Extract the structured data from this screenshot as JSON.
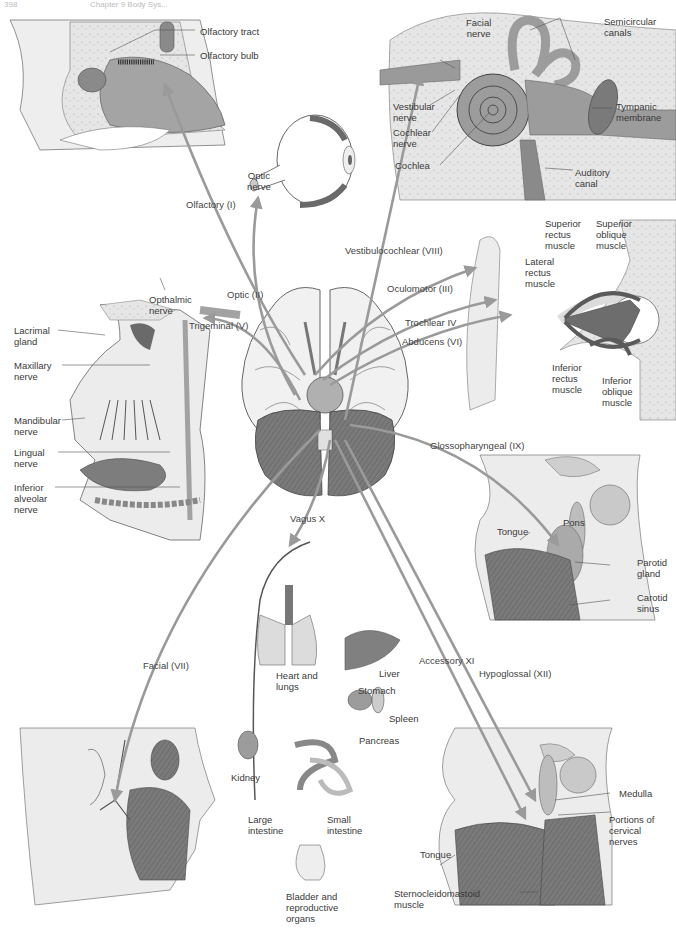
{
  "header": {
    "page_number": "398",
    "chapter": "Chapter 9 Body Sys..."
  },
  "colors": {
    "arrow": "#9a9a9a",
    "tissue_dark": "#7d7d7d",
    "tissue_mid": "#a8a8a8",
    "tissue_light": "#dcdcdc",
    "bone": "#e4e4e4",
    "line": "#555555"
  },
  "cranial_nerves": [
    {
      "id": "I",
      "label": "Olfactory (I)"
    },
    {
      "id": "II",
      "label": "Optic (II)"
    },
    {
      "id": "III",
      "label": "Oculomotor (III)"
    },
    {
      "id": "IV",
      "label": "Trochlear IV"
    },
    {
      "id": "V",
      "label": "Trigeminal (V)"
    },
    {
      "id": "VI",
      "label": "Abducens (VI)"
    },
    {
      "id": "VII",
      "label": "Facial (VII)"
    },
    {
      "id": "VIII",
      "label": "Vestibulocochlear (VIII)"
    },
    {
      "id": "IX",
      "label": "Glossopharyngeal (IX)"
    },
    {
      "id": "X",
      "label": "Vagus X"
    },
    {
      "id": "XI",
      "label": "Accessory XI"
    },
    {
      "id": "XII",
      "label": "Hypoglossal (XII)"
    }
  ],
  "panels": {
    "nose": {
      "labels": [
        "Olfactory tract",
        "Olfactory bulb"
      ]
    },
    "eye": {
      "labels": [
        "Optic\nnerve"
      ]
    },
    "ear": {
      "labels": [
        "Facial\nnerve",
        "Semicircular\ncanals",
        "Vestibular\nnerve",
        "Cochlear\nnerve",
        "Cochlea",
        "Tympanic\nmembrane",
        "Auditory\ncanal"
      ]
    },
    "orbit": {
      "labels": [
        "Superior\nrectus\nmuscle",
        "Superior\noblique\nmuscle",
        "Lateral\nrectus\nmuscle",
        "Inferior\nrectus\nmuscle",
        "Inferior\noblique\nmuscle"
      ]
    },
    "face_trigeminal": {
      "labels": [
        "Opthalmic\nnerve",
        "Lacrimal\ngland",
        "Maxillary\nnerve",
        "Mandibular\nnerve",
        "Lingual\nnerve",
        "Inferior\nalveolar\nnerve"
      ]
    },
    "throat": {
      "labels": [
        "Tongue",
        "Pons",
        "Parotid\ngland",
        "Carotid\nsinus"
      ]
    },
    "viscera": {
      "labels": [
        "Heart and\nlungs",
        "Liver",
        "Stomach",
        "Spleen",
        "Pancreas",
        "Kidney",
        "Large\nintestine",
        "Small\nintestine",
        "Bladder and\nreproductive\norgans"
      ]
    },
    "neck": {
      "labels": [
        "Medulla",
        "Portions of\ncervical\nnerves",
        "Tongue",
        "Sternocleidomastoid\nmuscle"
      ]
    }
  }
}
